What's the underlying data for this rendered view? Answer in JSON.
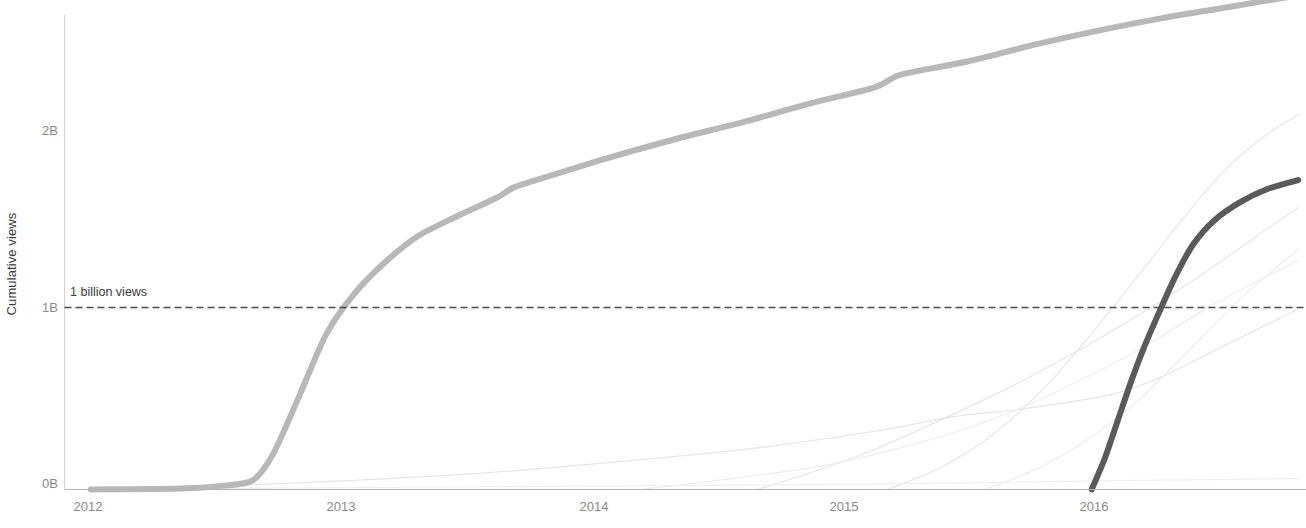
{
  "chart_data": {
    "type": "line",
    "title": "",
    "xlabel": "",
    "ylabel": "Cumulative views",
    "x_tick_labels": [
      "2012",
      "2013",
      "2014",
      "2015",
      "2016"
    ],
    "x_tick_values": [
      2012,
      2013,
      2014,
      2015,
      2016
    ],
    "xlim": [
      2011.9,
      2016.65
    ],
    "y_tick_labels": [
      "0B",
      "1B",
      "2B"
    ],
    "y_tick_values": [
      0,
      1000000000,
      2000000000
    ],
    "ylim": [
      0,
      2750000000
    ],
    "grid": false,
    "legend": "none",
    "annotations": [
      {
        "name": "one-billion-reference",
        "label": "1 billion views",
        "y_value": 1000000000,
        "style": "dashed-horizontal-line",
        "color": "#4a4a4a"
      }
    ],
    "series": [
      {
        "name": "highlighted-early-video",
        "emphasis": "primary",
        "color": "#b8b8b8",
        "width": 6,
        "points": [
          [
            2012.0,
            0.0
          ],
          [
            2012.35,
            0.005
          ],
          [
            2012.5,
            0.02
          ],
          [
            2012.62,
            0.05
          ],
          [
            2012.7,
            0.2
          ],
          [
            2012.8,
            0.52
          ],
          [
            2012.9,
            0.85
          ],
          [
            2013.0,
            1.06
          ],
          [
            2013.12,
            1.24
          ],
          [
            2013.25,
            1.39
          ],
          [
            2013.4,
            1.5
          ],
          [
            2013.55,
            1.6
          ],
          [
            2013.62,
            1.66
          ],
          [
            2013.75,
            1.72
          ],
          [
            2014.0,
            1.83
          ],
          [
            2014.25,
            1.93
          ],
          [
            2014.5,
            2.02
          ],
          [
            2014.75,
            2.12
          ],
          [
            2015.0,
            2.21
          ],
          [
            2015.1,
            2.28
          ],
          [
            2015.35,
            2.35
          ],
          [
            2015.6,
            2.44
          ],
          [
            2015.85,
            2.52
          ],
          [
            2016.1,
            2.59
          ],
          [
            2016.35,
            2.65
          ],
          [
            2016.6,
            2.71
          ]
        ]
      },
      {
        "name": "highlighted-recent-video",
        "emphasis": "primary",
        "color": "#5a5a5a",
        "width": 6,
        "points": [
          [
            2015.83,
            0.0
          ],
          [
            2015.88,
            0.17
          ],
          [
            2015.93,
            0.38
          ],
          [
            2015.98,
            0.59
          ],
          [
            2016.03,
            0.78
          ],
          [
            2016.09,
            0.98
          ],
          [
            2016.15,
            1.17
          ],
          [
            2016.22,
            1.35
          ],
          [
            2016.3,
            1.48
          ],
          [
            2016.4,
            1.58
          ],
          [
            2016.5,
            1.65
          ],
          [
            2016.62,
            1.7
          ]
        ]
      },
      {
        "name": "background-video-1",
        "emphasis": "faint",
        "color": "#e6e6e6",
        "width": 1.2,
        "points": [
          [
            2012.06,
            0.0
          ],
          [
            2012.5,
            0.02
          ],
          [
            2013.0,
            0.05
          ],
          [
            2013.5,
            0.09
          ],
          [
            2014.0,
            0.15
          ],
          [
            2014.5,
            0.22
          ],
          [
            2015.0,
            0.32
          ],
          [
            2015.3,
            0.4
          ],
          [
            2015.55,
            0.44
          ],
          [
            2015.9,
            0.52
          ],
          [
            2016.1,
            0.62
          ],
          [
            2016.35,
            0.8
          ],
          [
            2016.62,
            0.99
          ]
        ]
      },
      {
        "name": "background-video-2",
        "emphasis": "faint",
        "color": "#e6e6e6",
        "width": 1.2,
        "points": [
          [
            2014.55,
            0.0
          ],
          [
            2014.75,
            0.09
          ],
          [
            2015.0,
            0.22
          ],
          [
            2015.25,
            0.38
          ],
          [
            2015.5,
            0.55
          ],
          [
            2015.75,
            0.74
          ],
          [
            2016.0,
            0.95
          ],
          [
            2016.25,
            1.18
          ],
          [
            2016.45,
            1.38
          ],
          [
            2016.62,
            1.55
          ]
        ]
      },
      {
        "name": "background-video-3",
        "emphasis": "faint",
        "color": "#e6e6e6",
        "width": 1.2,
        "points": [
          [
            2015.05,
            0.0
          ],
          [
            2015.25,
            0.12
          ],
          [
            2015.45,
            0.3
          ],
          [
            2015.65,
            0.56
          ],
          [
            2015.82,
            0.84
          ],
          [
            2016.0,
            1.16
          ],
          [
            2016.18,
            1.49
          ],
          [
            2016.35,
            1.77
          ],
          [
            2016.5,
            1.95
          ],
          [
            2016.62,
            2.06
          ]
        ]
      },
      {
        "name": "background-video-4",
        "emphasis": "faint",
        "color": "#ededed",
        "width": 1.2,
        "points": [
          [
            2015.42,
            0.0
          ],
          [
            2015.6,
            0.1
          ],
          [
            2015.8,
            0.26
          ],
          [
            2016.0,
            0.48
          ],
          [
            2016.2,
            0.76
          ],
          [
            2016.4,
            1.05
          ],
          [
            2016.62,
            1.32
          ]
        ]
      },
      {
        "name": "background-video-5",
        "emphasis": "faint",
        "color": "#ededed",
        "width": 1.2,
        "points": [
          [
            2014.1,
            0.0
          ],
          [
            2014.4,
            0.05
          ],
          [
            2014.8,
            0.13
          ],
          [
            2015.1,
            0.23
          ],
          [
            2015.4,
            0.36
          ],
          [
            2015.7,
            0.54
          ],
          [
            2016.0,
            0.76
          ],
          [
            2016.3,
            1.02
          ],
          [
            2016.62,
            1.26
          ]
        ]
      },
      {
        "name": "background-video-6",
        "emphasis": "faint",
        "color": "#f0f0f0",
        "width": 1.2,
        "points": [
          [
            2012.1,
            0.0
          ],
          [
            2013.0,
            0.01
          ],
          [
            2014.0,
            0.02
          ],
          [
            2015.0,
            0.03
          ],
          [
            2016.0,
            0.05
          ],
          [
            2016.62,
            0.06
          ]
        ]
      }
    ]
  },
  "axes": {
    "y_axis_label": "Cumulative views",
    "y_axis_color": "#cfcfcf",
    "x_axis_color": "#b0b0b0",
    "tick_text_color": "#8a8a8a"
  },
  "cropped_header": {
    "text": ""
  }
}
